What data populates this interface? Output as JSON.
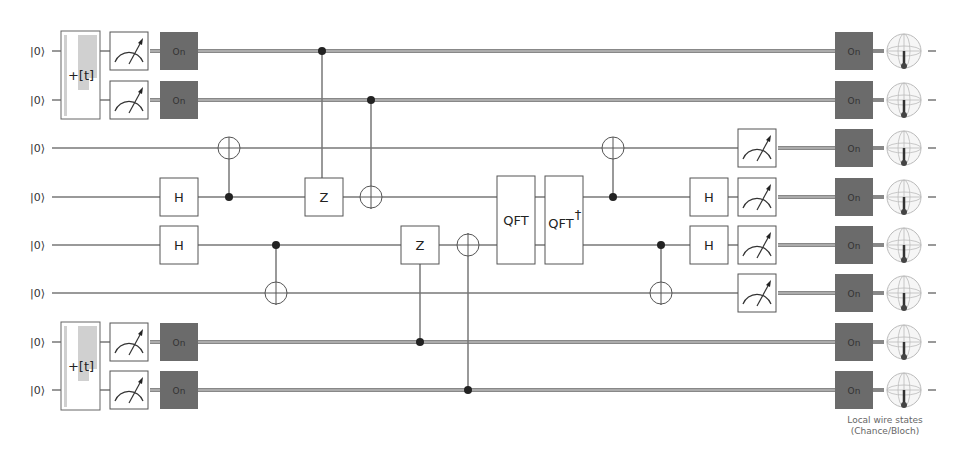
{
  "circuit": {
    "wire_count": 8,
    "wires": [
      {
        "index": 0,
        "y": 51,
        "init_label": "|0⟩"
      },
      {
        "index": 1,
        "y": 100,
        "init_label": "|0⟩"
      },
      {
        "index": 2,
        "y": 148,
        "init_label": "|0⟩"
      },
      {
        "index": 3,
        "y": 197,
        "init_label": "|0⟩"
      },
      {
        "index": 4,
        "y": 245,
        "init_label": "|0⟩"
      },
      {
        "index": 5,
        "y": 293,
        "init_label": "|0⟩"
      },
      {
        "index": 6,
        "y": 342,
        "init_label": "|0⟩"
      },
      {
        "index": 7,
        "y": 390,
        "init_label": "|0⟩"
      }
    ],
    "time_gates": [
      {
        "label": "+[t]",
        "wires": [
          0,
          1
        ]
      },
      {
        "label": "+[t]",
        "wires": [
          6,
          7
        ]
      }
    ],
    "gates": {
      "hadamard_label": "H",
      "z_label": "Z",
      "qft_label": "QFT",
      "qft_dagger_label": "QFT",
      "dagger_symbol": "†"
    },
    "on_label": "On",
    "colors": {
      "wire": "#777777",
      "classical_wire": "#8a8a8a",
      "on_box": "#6b6b6b",
      "gate_border": "#555555",
      "control_dot": "#222222",
      "time_gate_fill": "#d0d0d0",
      "bloch_sphere": "#bbbbbb",
      "bloch_vector": "#333333"
    }
  },
  "display": {
    "caption_line1": "Local wire states",
    "caption_line2": "(Chance/Bloch)"
  }
}
